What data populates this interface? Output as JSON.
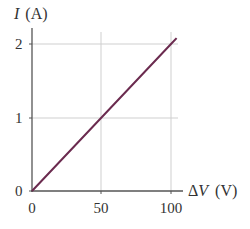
{
  "chart_data": {
    "type": "line",
    "title": "",
    "xlabel": "ΔV (V)",
    "ylabel": "I (A)",
    "ylabel_symbol": "I",
    "ylabel_unit": "(A)",
    "xlabel_symbol": "ΔV",
    "xlabel_unit": "(V)",
    "xlim": [
      0,
      105
    ],
    "ylim": [
      0,
      2.1
    ],
    "x_ticks": [
      0,
      50,
      100
    ],
    "y_ticks": [
      0,
      1,
      2
    ],
    "x_tick_labels": [
      "0",
      "50",
      "100"
    ],
    "y_tick_labels": [
      "0",
      "1",
      "2"
    ],
    "grid": true,
    "legend": null,
    "series": [
      {
        "name": "I vs ΔV",
        "x": [
          0,
          50,
          100,
          104
        ],
        "values": [
          0,
          1,
          2,
          2.08
        ],
        "color": "#6b2b4f"
      }
    ]
  }
}
